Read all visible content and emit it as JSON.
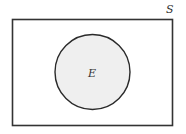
{
  "diagram": {
    "type": "venn",
    "universe": {
      "label": "S",
      "stroke": "#333333",
      "fill": "#ffffff"
    },
    "sets": [
      {
        "label": "E",
        "fill": "#efefef",
        "stroke": "#2a2a2a"
      }
    ]
  }
}
